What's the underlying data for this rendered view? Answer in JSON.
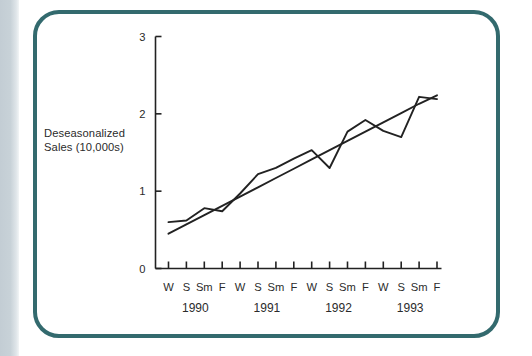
{
  "figure": {
    "frame_color": "#336a6e",
    "background": "#ffffff",
    "strip_color": "#c8d2d8",
    "ink_color": "#222222"
  },
  "axis_labels": {
    "y_label_line1": "Deseasonalized",
    "y_label_line2": "Sales (10,000s)",
    "y_ticks": [
      "0",
      "1",
      "2",
      "3"
    ],
    "season_ticks": [
      "W",
      "S",
      "Sm",
      "F",
      "W",
      "S",
      "Sm",
      "F",
      "W",
      "S",
      "Sm",
      "F",
      "W",
      "S",
      "Sm",
      "F"
    ],
    "year_labels": [
      "1990",
      "1991",
      "1992",
      "1993"
    ]
  },
  "chart_data": {
    "type": "line",
    "title": "",
    "xlabel": "",
    "ylabel": "Deseasonalized Sales (10,000s)",
    "ylim": [
      0,
      3
    ],
    "yticks": [
      0,
      1,
      2,
      3
    ],
    "grid": false,
    "legend": "none",
    "x": [
      "1990 W",
      "1990 S",
      "1990 Sm",
      "1990 F",
      "1991 W",
      "1991 S",
      "1991 Sm",
      "1991 F",
      "1992 W",
      "1992 S",
      "1992 Sm",
      "1992 F",
      "1993 W",
      "1993 S",
      "1993 Sm",
      "1993 F"
    ],
    "series": [
      {
        "name": "Deseasonalized sales",
        "type": "line",
        "values": [
          0.6,
          0.62,
          0.78,
          0.74,
          0.97,
          1.22,
          1.3,
          1.42,
          1.53,
          1.3,
          1.77,
          1.92,
          1.78,
          1.7,
          2.22,
          2.19
        ]
      },
      {
        "name": "Trend line",
        "type": "line",
        "values": [
          0.45,
          0.57,
          0.69,
          0.81,
          0.93,
          1.05,
          1.17,
          1.29,
          1.41,
          1.53,
          1.65,
          1.77,
          1.89,
          2.01,
          2.13,
          2.24
        ]
      }
    ],
    "annotations": []
  }
}
